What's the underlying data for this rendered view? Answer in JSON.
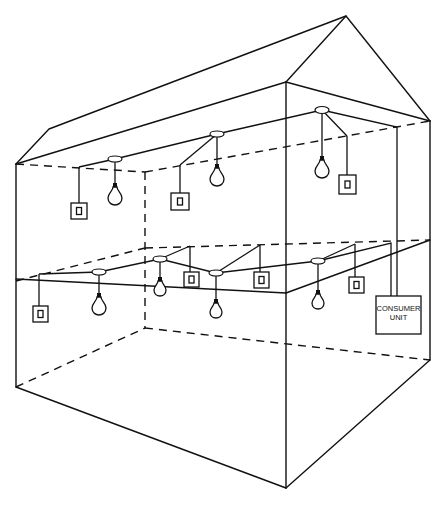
{
  "diagram": {
    "type": "house-lighting-circuit",
    "floors": [
      "first-floor",
      "ground-floor"
    ],
    "consumer_unit": {
      "label_line1": "CONSUMER",
      "label_line2": "UNIT"
    },
    "first_floor": {
      "lights": 3,
      "switches": 3
    },
    "ground_floor": {
      "lights": 4,
      "switches": 4
    },
    "colors": {
      "line": "#111111",
      "background": "#ffffff"
    }
  }
}
